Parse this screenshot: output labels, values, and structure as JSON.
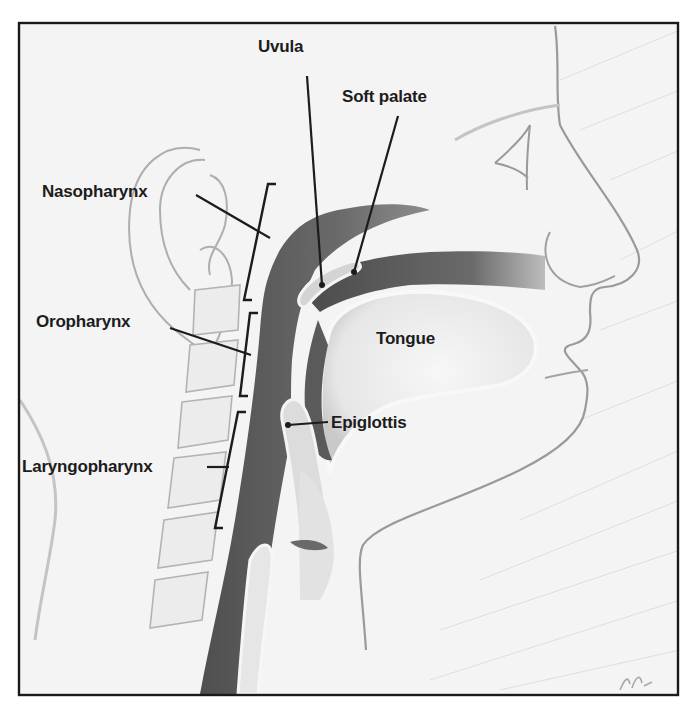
{
  "diagram": {
    "colors": {
      "frame_border": "#1a1a1a",
      "background": "#f4f4f4",
      "airway_dark": "#5e5e5e",
      "airway_mid": "#8a8a8a",
      "sketch_line": "#9a9a9a",
      "label_text": "#1c1c1c",
      "leader_line": "#1c1c1c"
    },
    "labels": [
      {
        "id": "uvula",
        "text": "Uvula",
        "x": 258,
        "y": 38
      },
      {
        "id": "soft-palate",
        "text": "Soft palate",
        "x": 342,
        "y": 88
      },
      {
        "id": "nasopharynx",
        "text": "Nasopharynx",
        "x": 42,
        "y": 183
      },
      {
        "id": "oropharynx",
        "text": "Oropharynx",
        "x": 36,
        "y": 313
      },
      {
        "id": "tongue",
        "text": "Tongue",
        "x": 376,
        "y": 330
      },
      {
        "id": "epiglottis",
        "text": "Epiglottis",
        "x": 331,
        "y": 414
      },
      {
        "id": "laryngopharynx",
        "text": "Laryngopharynx",
        "x": 22,
        "y": 458
      }
    ],
    "regions": [
      {
        "id": "nasopharynx",
        "bracket_top": 182,
        "bracket_bottom": 302
      },
      {
        "id": "oropharynx",
        "bracket_top": 312,
        "bracket_bottom": 396
      },
      {
        "id": "laryngopharynx",
        "bracket_top": 410,
        "bracket_bottom": 528
      }
    ]
  }
}
